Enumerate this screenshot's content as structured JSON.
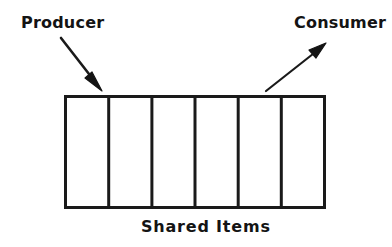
{
  "diagram": {
    "style": {
      "background_color": "#ffffff",
      "ink_color": "#141414",
      "stroke_color": "#1a1a1a"
    },
    "labels": {
      "producer": "Producer",
      "consumer": "Consumer",
      "shared_items": "Shared Items"
    },
    "buffer": {
      "cell_count": 6,
      "cells": [
        "",
        "",
        "",
        "",
        "",
        ""
      ],
      "x": 64,
      "y": 95,
      "width": 262,
      "height": 114,
      "outer_stroke_width": 3,
      "divider_stroke_width": 3,
      "fill": "#ffffff"
    },
    "arrows": [
      {
        "name": "producer-arrow",
        "label": "Producer",
        "direction": "into-buffer",
        "from_x": 61,
        "from_y": 38,
        "to_x": 101,
        "to_y": 90,
        "stroke_width": 2.6
      },
      {
        "name": "consumer-arrow",
        "label": "Consumer",
        "direction": "out-of-buffer",
        "from_x": 266,
        "from_y": 91,
        "to_x": 326,
        "to_y": 43,
        "stroke_width": 2.2
      }
    ]
  }
}
